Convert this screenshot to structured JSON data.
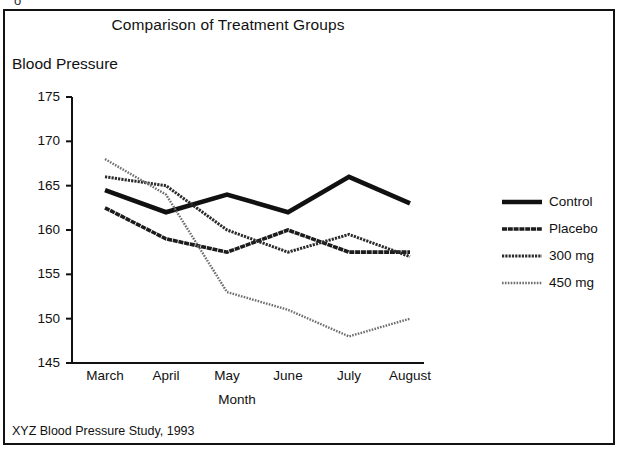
{
  "figure": {
    "title": "Comparison of Treatment Groups",
    "y_axis_title": "Blood Pressure",
    "x_axis_title": "Month",
    "footer": "XYZ Blood Pressure Study, 1993",
    "scan_artifact": "o"
  },
  "chart_data": {
    "type": "line",
    "title": "Comparison of Treatment Groups",
    "xlabel": "Month",
    "ylabel": "Blood Pressure",
    "categories": [
      "March",
      "April",
      "May",
      "June",
      "July",
      "August"
    ],
    "ylim": [
      145,
      175
    ],
    "yticks": [
      145,
      150,
      155,
      160,
      165,
      170,
      175
    ],
    "ytick_labels": [
      "145",
      "150",
      "155",
      "160",
      "165",
      "170",
      "175"
    ],
    "grid": false,
    "legend_position": "right",
    "series": [
      {
        "name": "Control",
        "values": [
          164.5,
          162.0,
          164.0,
          162.0,
          166.0,
          163.0
        ],
        "style": "solid-heavy",
        "color": "#111111",
        "width": 4.6
      },
      {
        "name": "Placebo",
        "values": [
          162.5,
          159.0,
          157.5,
          160.0,
          157.5,
          157.5
        ],
        "style": "solid-medium",
        "color": "#1c1c1c",
        "width": 3.6
      },
      {
        "name": "300 mg",
        "values": [
          166.0,
          165.0,
          160.0,
          157.5,
          159.5,
          157.0
        ],
        "style": "dotted-fine",
        "color": "#2b2b2b",
        "width": 3.0
      },
      {
        "name": "450 mg",
        "values": [
          168.0,
          164.0,
          153.0,
          151.0,
          148.0,
          150.0
        ],
        "style": "dotted-light",
        "color": "#6e6e6e",
        "width": 2.4
      }
    ]
  },
  "legend": {
    "entries": [
      {
        "label": "Control"
      },
      {
        "label": "Placebo"
      },
      {
        "label": "300 mg"
      },
      {
        "label": "450 mg"
      }
    ]
  }
}
